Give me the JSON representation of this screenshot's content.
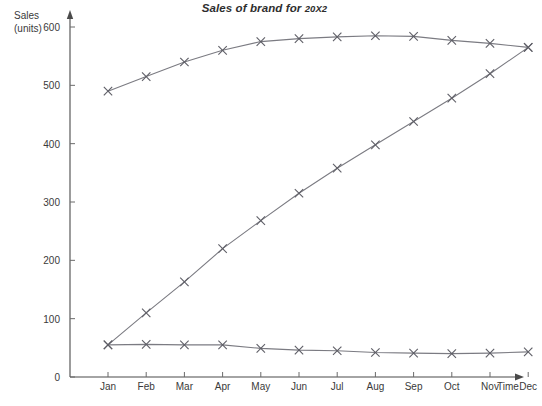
{
  "chart_data": {
    "type": "line",
    "title": "Sales of brand for 20X2",
    "title_main": "Sales of brand for ",
    "title_year": "20X2",
    "xlabel": "Time",
    "ylabel": "Sales (units)",
    "ylabel_line1": "Sales",
    "ylabel_line2": "(units)",
    "grid": false,
    "legend": "none",
    "xlim_categories": [
      "Jan",
      "Feb",
      "Mar",
      "Apr",
      "May",
      "Jun",
      "Jul",
      "Aug",
      "Sep",
      "Oct",
      "Nov",
      "Dec"
    ],
    "ylim": [
      0,
      600
    ],
    "yticks": [
      0,
      100,
      200,
      300,
      400,
      500,
      600
    ],
    "categories": [
      "Jan",
      "Feb",
      "Mar",
      "Apr",
      "May",
      "Jun",
      "Jul",
      "Aug",
      "Sep",
      "Oct",
      "Nov",
      "Dec"
    ],
    "series": [
      {
        "name": "upper-curve",
        "marker": "x",
        "color": "#7b7b82",
        "values": [
          490,
          515,
          540,
          560,
          575,
          580,
          583,
          585,
          584,
          577,
          572,
          565
        ]
      },
      {
        "name": "rising-curve",
        "marker": "x",
        "color": "#7b7b82",
        "values": [
          55,
          110,
          163,
          220,
          268,
          315,
          358,
          398,
          438,
          478,
          520,
          565
        ]
      },
      {
        "name": "lower-curve",
        "marker": "x",
        "color": "#7b7b82",
        "values": [
          55,
          56,
          55,
          55,
          49,
          46,
          45,
          42,
          41,
          40,
          41,
          43
        ]
      }
    ]
  },
  "axes": {
    "y_arrow": true,
    "x_arrow": true,
    "axis_color": "#4a4a4a"
  }
}
